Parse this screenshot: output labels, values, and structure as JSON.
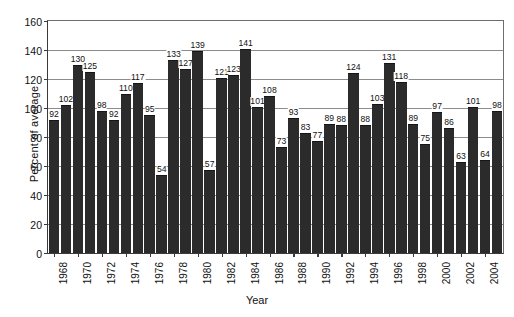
{
  "chart_data": {
    "type": "bar",
    "title": "",
    "xlabel": "Year",
    "ylabel": "Percent of average",
    "ylim": [
      0,
      160
    ],
    "ytick_step": 20,
    "yticks": [
      0,
      20,
      40,
      60,
      80,
      100,
      120,
      140,
      160
    ],
    "grid": true,
    "legend": null,
    "bar_color": "#2b2b2b",
    "categories": [
      "1968",
      "1969",
      "1970",
      "1971",
      "1972",
      "1973",
      "1974",
      "1975",
      "1976",
      "1977",
      "1978",
      "1979",
      "1980",
      "1981",
      "1982",
      "1983",
      "1984",
      "1985",
      "1986",
      "1987",
      "1988",
      "1989",
      "1990",
      "1991",
      "1992",
      "1993",
      "1994",
      "1995",
      "1996",
      "1997",
      "1998",
      "1999",
      "2000",
      "2001",
      "2002",
      "2003",
      "2004",
      "2005"
    ],
    "values": [
      92,
      102,
      130,
      125,
      98,
      92,
      110,
      117,
      95,
      54,
      133,
      127,
      139,
      57,
      121,
      123,
      141,
      101,
      108,
      73,
      93,
      83,
      77,
      89,
      88,
      124,
      88,
      103,
      131,
      118,
      89,
      75,
      97,
      86,
      63,
      101,
      64,
      98
    ],
    "xtick_labels": [
      "1968",
      "1970",
      "1972",
      "1974",
      "1976",
      "1978",
      "1980",
      "1982",
      "1984",
      "1986",
      "1988",
      "1990",
      "1992",
      "1994",
      "1996",
      "1998",
      "2000",
      "2002",
      "2004"
    ]
  }
}
